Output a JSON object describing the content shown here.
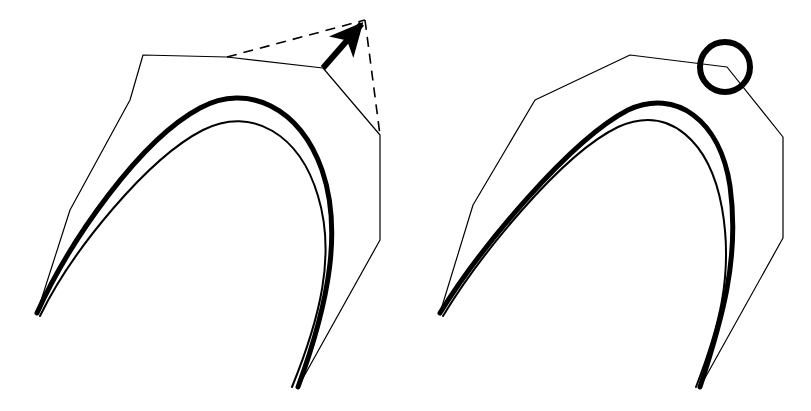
{
  "figure": {
    "background_color": "#ffffff",
    "ink_color": "#000000",
    "width": 811,
    "height": 411,
    "thin_stroke_width": 1.2,
    "medium_stroke_width": 2.0,
    "thick_stroke_width": 5.0,
    "circle_stroke_width": 6.0,
    "dash_pattern": "10 7"
  },
  "panels": [
    {
      "id": "left-panel",
      "label": "left",
      "annotation_type": "arrow-and-dashed-triangle",
      "control_polygon": {
        "name": "control-polygon",
        "closed": false,
        "stroke": "#000000",
        "stroke_width": 1.2,
        "points": "37,313 70,210 130,100 143,55 227,57 323,68 380,135 380,240 298,387"
      },
      "thick_curve": {
        "name": "thick-bezier-curve",
        "stroke": "#000000",
        "stroke_width": 5.0,
        "path": "M 37,313 C 70,240 140,140 200,108 C 248,82 300,108 322,170 C 342,228 330,300 298,387"
      },
      "thin_curve": {
        "name": "thin-bezier-curve",
        "stroke": "#000000",
        "stroke_width": 2.0,
        "path": "M 40,316 C 72,250 148,158 203,130 C 252,105 300,135 318,196 C 336,255 320,318 292,387"
      },
      "dashed_lines": [
        {
          "name": "dashed-tangent-upper",
          "points": "227,57 365,20",
          "dash": "10 7"
        },
        {
          "name": "dashed-tangent-right",
          "points": "365,20 380,135",
          "dash": "10 7"
        }
      ],
      "arrow": {
        "name": "direction-arrow",
        "from": "323,68",
        "to": "365,20",
        "stroke_width": 6.0,
        "head_length": 26,
        "head_width": 15
      }
    },
    {
      "id": "right-panel",
      "label": "right",
      "annotation_type": "circle-highlight",
      "control_polygon": {
        "name": "control-polygon",
        "closed": false,
        "stroke": "#000000",
        "stroke_width": 1.2,
        "points": "440,313 473,205 535,100 630,55 727,67 783,137 783,238 700,387"
      },
      "thick_curve": {
        "name": "thick-bezier-curve",
        "stroke": "#000000",
        "stroke_width": 5.0,
        "path": "M 440,313 C 480,248 570,140 628,110 C 676,88 720,120 730,186 C 740,258 722,320 700,387"
      },
      "thin_curve": {
        "name": "thin-bezier-curve",
        "stroke": "#000000",
        "stroke_width": 2.0,
        "path": "M 443,316 C 478,258 560,155 618,127 C 670,104 710,142 722,208 C 734,276 718,330 696,387"
      },
      "highlight_circle": {
        "name": "highlight-circle",
        "cx": 725,
        "cy": 67,
        "r": 25,
        "stroke": "#000000",
        "stroke_width": 6.0,
        "fill": "none"
      }
    }
  ]
}
